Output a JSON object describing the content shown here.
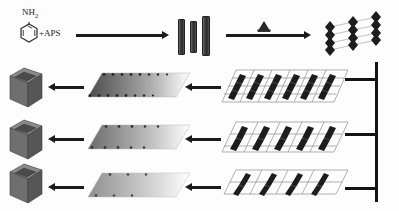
{
  "figure": {
    "background_color": "#fdfdfd",
    "width": 399,
    "height": 211
  },
  "reagents": {
    "amine_label": "NH",
    "amine_subscript": "2",
    "oxidant_label": "+APS",
    "ring_name": "benzene-ring",
    "description": "aniline monomer plus ammonium persulfate initiator"
  },
  "steps": {
    "arrow1": {
      "name": "polymerization-arrow",
      "direction": "right",
      "label": ""
    },
    "arrow2": {
      "name": "assembly-arrow",
      "direction": "right",
      "label": ""
    },
    "cone": {
      "name": "cone-template",
      "color": "#262626"
    }
  },
  "nanorods": {
    "name": "nanorod-group",
    "count": 3,
    "color_dark": "#2a2a2a",
    "color_light": "#6d6d6d",
    "heights": [
      34,
      30,
      38
    ]
  },
  "assembly_top": {
    "name": "stacked-cone-assembly",
    "columns": 3,
    "units_per_column": 4,
    "color": "#1c1c1c",
    "connector_color": "#b9b9b9"
  },
  "rows": [
    {
      "index": 1,
      "lattice": {
        "name": "lattice-dense",
        "cols": 6,
        "rows": 3,
        "density": "dense",
        "line_color": "#8d8d8d",
        "motif_color": "#1d1d1d"
      },
      "sheet": {
        "name": "gradient-sheet-dark",
        "gradient_from": "#4a4a4a",
        "gradient_to": "#ffffff",
        "dot_count": 11,
        "dot_color": "#2a2a2a"
      },
      "cube": {
        "name": "product-cube-1",
        "top_color": "#8a8a8a",
        "front_color": "#6f6f6f",
        "side_color": "#565656",
        "inner_color": "#4a4a4a"
      },
      "arrow_left": {
        "name": "transfer-arrow-row1",
        "direction": "left"
      },
      "arrow_mid": {
        "name": "casting-arrow-row1",
        "direction": "left"
      }
    },
    {
      "index": 2,
      "lattice": {
        "name": "lattice-medium",
        "cols": 5,
        "rows": 2,
        "density": "medium",
        "line_color": "#8d8d8d",
        "motif_color": "#1d1d1d"
      },
      "sheet": {
        "name": "gradient-sheet-medium",
        "gradient_from": "#6b6b6b",
        "gradient_to": "#ffffff",
        "dot_count": 8,
        "dot_color": "#3a3a3a"
      },
      "cube": {
        "name": "product-cube-2",
        "top_color": "#8a8a8a",
        "front_color": "#6f6f6f",
        "side_color": "#565656",
        "inner_color": "#4a4a4a"
      },
      "arrow_left": {
        "name": "transfer-arrow-row2",
        "direction": "left"
      },
      "arrow_mid": {
        "name": "casting-arrow-row2",
        "direction": "left"
      }
    },
    {
      "index": 3,
      "lattice": {
        "name": "lattice-sparse",
        "cols": 4,
        "rows": 2,
        "density": "sparse",
        "line_color": "#8d8d8d",
        "motif_color": "#1d1d1d"
      },
      "sheet": {
        "name": "gradient-sheet-light",
        "gradient_from": "#8f8f8f",
        "gradient_to": "#ffffff",
        "dot_count": 6,
        "dot_color": "#4a4a4a"
      },
      "cube": {
        "name": "product-cube-3",
        "top_color": "#8a8a8a",
        "front_color": "#6f6f6f",
        "side_color": "#565656",
        "inner_color": "#4a4a4a"
      },
      "arrow_left": {
        "name": "transfer-arrow-row3",
        "direction": "left"
      },
      "arrow_mid": {
        "name": "casting-arrow-row3",
        "direction": "left"
      }
    }
  ],
  "distribution_trunk": {
    "name": "distribution-trunk",
    "color": "#141414",
    "branches": 3
  },
  "colors": {
    "ink": "#1a1a1a",
    "arrow": "#1b1b1b",
    "lattice_line": "#8d8d8d",
    "motif": "#1d1d1d"
  }
}
